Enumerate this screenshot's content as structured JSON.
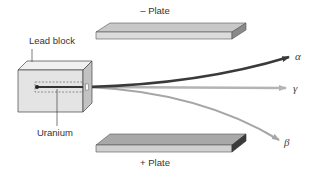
{
  "diagram": {
    "labels": {
      "negative_plate": "– Plate",
      "positive_plate": "+ Plate",
      "lead_block": "Lead block",
      "uranium": "Uranium",
      "alpha": "α",
      "gamma": "γ",
      "beta": "β"
    },
    "colors": {
      "alpha_ray": "#3a3a3a",
      "gamma_ray": "#b4b4b4",
      "beta_ray": "#a6a6a6",
      "plate_top": "#c8c8c8",
      "plate_front": "#dcdcdc",
      "plate_side": "#707070",
      "block_front": "#e6e6e6",
      "block_top": "#f2f2f2",
      "block_side": "#c4c4c4"
    }
  }
}
